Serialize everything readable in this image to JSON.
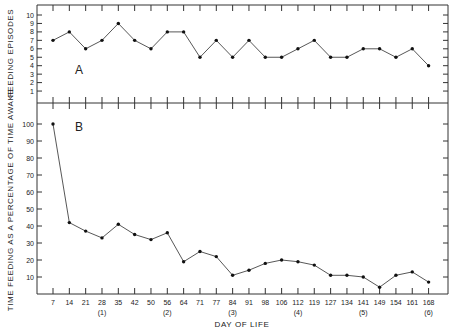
{
  "chart_data": [
    {
      "panel": "A",
      "type": "line",
      "ylabel": "FEEDING EPISODES",
      "xlabel": "DAY OF LIFE",
      "yticks": [
        1,
        2,
        3,
        4,
        5,
        6,
        7,
        8,
        9,
        10
      ],
      "ylim": [
        0,
        10.8
      ],
      "x": [
        7,
        14,
        21,
        28,
        35,
        42,
        50,
        56,
        64,
        71,
        77,
        84,
        91,
        98,
        106,
        112,
        119,
        127,
        134,
        141,
        149,
        154,
        161,
        168
      ],
      "values": [
        7,
        8,
        6,
        7,
        9,
        7,
        6,
        8,
        8,
        5,
        7,
        5,
        7,
        5,
        5,
        6,
        7,
        5,
        5,
        6,
        6,
        5,
        6,
        4
      ],
      "grid": false
    },
    {
      "panel": "B",
      "type": "line",
      "ylabel": "TIME FEEDING AS A PERCENTAGE OF TIME AWAKE",
      "xlabel": "DAY OF LIFE",
      "yticks": [
        10,
        20,
        30,
        40,
        50,
        60,
        70,
        80,
        90,
        100
      ],
      "ylim": [
        0,
        105
      ],
      "x": [
        7,
        14,
        21,
        28,
        35,
        42,
        50,
        56,
        64,
        71,
        77,
        84,
        91,
        98,
        106,
        112,
        119,
        127,
        134,
        141,
        149,
        154,
        161,
        168
      ],
      "values": [
        100,
        42,
        37,
        33,
        41,
        35,
        32,
        36,
        19,
        25,
        22,
        11,
        14,
        18,
        20,
        19,
        17,
        11,
        11,
        10,
        4,
        11,
        13,
        7
      ],
      "grid": false
    }
  ],
  "panels": {
    "a": {
      "label": "A",
      "ylabel": "FEEDING EPISODES",
      "yticks": [
        "1",
        "2",
        "3",
        "4",
        "5",
        "6",
        "7",
        "8",
        "9",
        "10"
      ]
    },
    "b": {
      "label": "B",
      "ylabel": "TIME FEEDING AS A PERCENTAGE OF TIME AWAKE",
      "yticks": [
        "10",
        "20",
        "30",
        "40",
        "50",
        "60",
        "70",
        "80",
        "90",
        "100"
      ]
    }
  },
  "xaxis": {
    "title": "DAY OF LIFE",
    "ticks": [
      "7",
      "14",
      "21",
      "28",
      "35",
      "42",
      "50",
      "56",
      "64",
      "71",
      "77",
      "84",
      "91",
      "98",
      "106",
      "112",
      "119",
      "127",
      "134",
      "141",
      "149",
      "154",
      "161",
      "168"
    ],
    "groups": [
      {
        "label": "(1)",
        "at_index": 3
      },
      {
        "label": "(2)",
        "at_index": 7
      },
      {
        "label": "(3)",
        "at_index": 11
      },
      {
        "label": "(4)",
        "at_index": 15
      },
      {
        "label": "(5)",
        "at_index": 19
      },
      {
        "label": "(6)",
        "at_index": 23
      }
    ]
  }
}
